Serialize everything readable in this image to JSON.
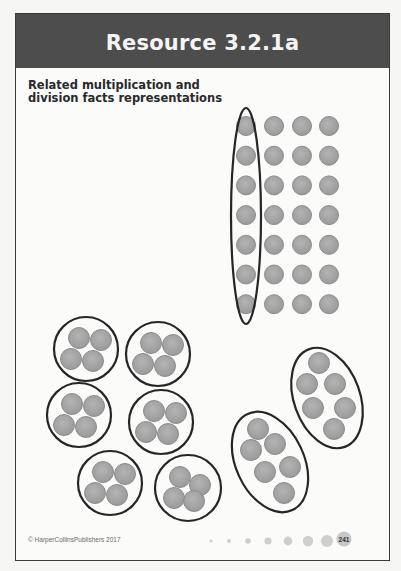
{
  "header": {
    "title": "Resource 3.2.1a"
  },
  "subtitle": "Related multiplication and division facts representations",
  "colors": {
    "header_band": "#4d4d4d",
    "counter_fill": "#a3a3a3",
    "counter_edge": "#8c8c8c",
    "outline": "#262626",
    "frame": "#3a3a3a"
  },
  "array": {
    "rows": 7,
    "columns": 4,
    "circled_column": 1,
    "description": "7 × 4 array of counters with the first column (7 counters) circled"
  },
  "groups_of_four": {
    "count": 6,
    "counters_per_group": 4,
    "description": "6 circles each containing 4 counters"
  },
  "groups_of_six": {
    "count": 2,
    "counters_per_group": 6,
    "description": "2 ovals each containing 6 counters"
  },
  "footer": {
    "copyright": "© HarperCollinsPublishers 2017",
    "page_number": "241",
    "decorative_dots": 7
  }
}
